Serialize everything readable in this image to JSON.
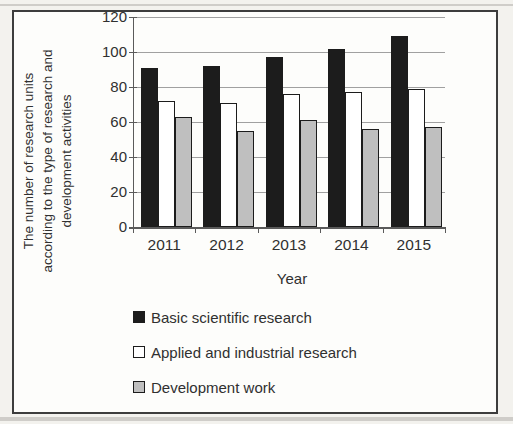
{
  "figure": {
    "kind": "scanned bar chart figure",
    "paper_color": "#f3f2ee",
    "frame_background": "#fdfdfb",
    "frame_border_color": "#3d3d3d"
  },
  "colors": {
    "text": "#303030",
    "axis": "#5a5a5a",
    "gridline": "#a0a0a0",
    "bar_border": "#1c1c1c",
    "scan_artifact": "#cfcdc9"
  },
  "chart_data": {
    "type": "bar",
    "title": "",
    "categories": [
      "2011",
      "2012",
      "2013",
      "2014",
      "2015"
    ],
    "series": [
      {
        "name": "Basic scientific research",
        "color": "#1c1c1c",
        "values": [
          91,
          92,
          97,
          102,
          109
        ]
      },
      {
        "name": "Applied and industrial research",
        "color": "#ffffff",
        "values": [
          72,
          71,
          76,
          77,
          79
        ]
      },
      {
        "name": "Development work",
        "color": "#bfbfbf",
        "values": [
          63,
          55,
          61,
          56,
          57
        ]
      }
    ],
    "xlabel": "Year",
    "ylabel": "The number of research units according to the type of research and development activities",
    "ylabel_lines": [
      "The number of research units",
      "according to the type of research and",
      "development activities"
    ],
    "ylim": [
      0,
      120
    ],
    "ytick_step": 20,
    "yticks": [
      "0",
      "20",
      "40",
      "60",
      "80",
      "100",
      "120"
    ],
    "grid": true,
    "legend_position": "bottom-left"
  }
}
